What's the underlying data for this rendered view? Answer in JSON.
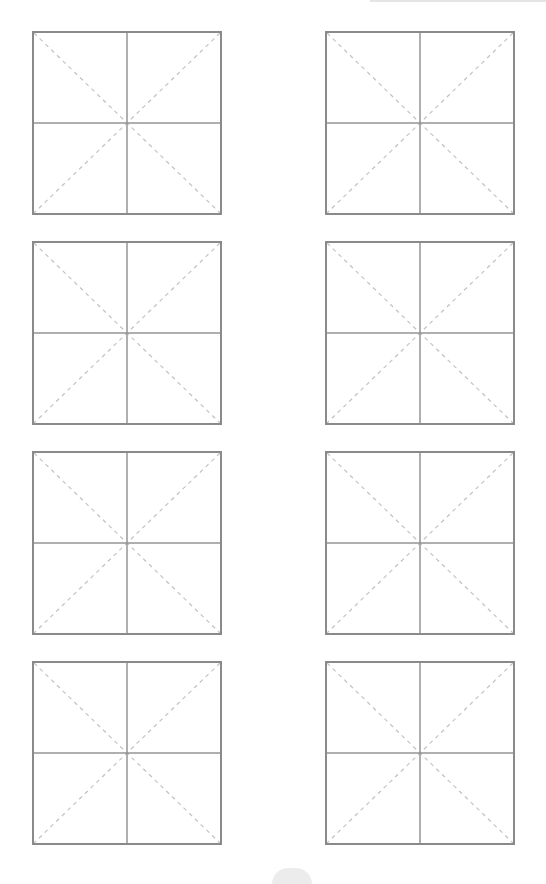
{
  "worksheet": {
    "type": "mi-zi-ge practice grid",
    "columns": 2,
    "rows": 4,
    "cells": [
      {
        "row": 1,
        "col": 1,
        "content": ""
      },
      {
        "row": 1,
        "col": 2,
        "content": ""
      },
      {
        "row": 2,
        "col": 1,
        "content": ""
      },
      {
        "row": 2,
        "col": 2,
        "content": ""
      },
      {
        "row": 3,
        "col": 1,
        "content": ""
      },
      {
        "row": 3,
        "col": 2,
        "content": ""
      },
      {
        "row": 4,
        "col": 1,
        "content": ""
      },
      {
        "row": 4,
        "col": 2,
        "content": ""
      }
    ]
  },
  "colors": {
    "border": "#8a8a8a",
    "center_lines": "#959595",
    "diagonal_dashes": "#c2c2c2",
    "background": "#ffffff"
  }
}
